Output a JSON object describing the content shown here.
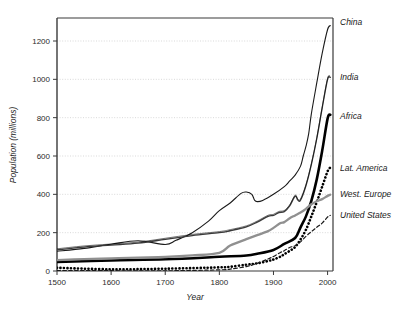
{
  "chart_data": {
    "type": "line",
    "title": "",
    "xlabel": "Year",
    "ylabel": "Population (millions)",
    "xlim": [
      1500,
      2010
    ],
    "ylim": [
      0,
      1320
    ],
    "xticks": [
      1500,
      1600,
      1700,
      1800,
      1900,
      2000
    ],
    "xticklabels": [
      "1500",
      "1600",
      "1700",
      "1800",
      "1900",
      "2000"
    ],
    "yticks": [
      0,
      200,
      400,
      600,
      800,
      1000,
      1200
    ],
    "yticklabels": [
      "0",
      "200",
      "400",
      "600",
      "800",
      "1000",
      "1200"
    ],
    "grid": "horizontal-dotted",
    "legend_position": "right-of-axes-inline",
    "series": [
      {
        "name": "China",
        "label": "China",
        "style": "solid",
        "color": "#1a1a1a",
        "width": 1.1,
        "label_y_value": 1300,
        "x": [
          1500,
          1550,
          1600,
          1650,
          1700,
          1720,
          1750,
          1780,
          1800,
          1820,
          1840,
          1850,
          1860,
          1865,
          1870,
          1880,
          1900,
          1920,
          1930,
          1940,
          1950,
          1955,
          1960,
          1965,
          1970,
          1980,
          1990,
          2000,
          2005
        ],
        "values": [
          103,
          118,
          140,
          158,
          138,
          160,
          200,
          260,
          315,
          355,
          405,
          412,
          400,
          370,
          362,
          368,
          400,
          440,
          470,
          500,
          547,
          600,
          650,
          715,
          820,
          981,
          1135,
          1260,
          1280
        ]
      },
      {
        "name": "India",
        "label": "India",
        "style": "solid-double",
        "color": "#3a3a3a",
        "width": 1.3,
        "label_y_value": 1010,
        "x": [
          1500,
          1550,
          1600,
          1650,
          1700,
          1750,
          1800,
          1820,
          1850,
          1870,
          1890,
          1900,
          1910,
          1920,
          1930,
          1940,
          1945,
          1950,
          1960,
          1970,
          1980,
          1990,
          2000,
          2005
        ],
        "values": [
          110,
          125,
          135,
          145,
          165,
          185,
          200,
          210,
          230,
          255,
          285,
          290,
          305,
          310,
          340,
          390,
          370,
          370,
          445,
          555,
          690,
          850,
          1000,
          1010
        ]
      },
      {
        "name": "Africa",
        "label": "Africa",
        "style": "thick-solid",
        "color": "#000000",
        "width": 2.6,
        "label_y_value": 810,
        "x": [
          1500,
          1600,
          1700,
          1800,
          1850,
          1870,
          1900,
          1920,
          1940,
          1950,
          1960,
          1970,
          1980,
          1990,
          2000,
          2005
        ],
        "values": [
          47,
          55,
          61,
          74,
          81,
          90,
          110,
          141,
          172,
          228,
          285,
          366,
          478,
          627,
          795,
          815
        ]
      },
      {
        "name": "Lat. America",
        "label": "Lat. America",
        "style": "dotted",
        "color": "#000000",
        "width": 2.6,
        "label_y_value": 540,
        "x": [
          1500,
          1600,
          1700,
          1800,
          1820,
          1850,
          1870,
          1890,
          1900,
          1913,
          1920,
          1930,
          1940,
          1950,
          1960,
          1970,
          1980,
          1990,
          2000,
          2005
        ],
        "values": [
          17,
          9,
          12,
          19,
          22,
          33,
          40,
          52,
          60,
          75,
          88,
          105,
          125,
          165,
          215,
          285,
          360,
          440,
          520,
          540
        ]
      },
      {
        "name": "West. Europe",
        "label": "West. Europe",
        "style": "solid",
        "color": "#909090",
        "width": 2.3,
        "label_y_value": 400,
        "x": [
          1500,
          1550,
          1600,
          1650,
          1700,
          1750,
          1800,
          1820,
          1850,
          1870,
          1890,
          1900,
          1913,
          1920,
          1930,
          1940,
          1950,
          1960,
          1970,
          1980,
          1990,
          2000,
          2005
        ],
        "values": [
          57,
          62,
          66,
          70,
          73,
          81,
          95,
          133,
          166,
          187,
          208,
          225,
          250,
          255,
          275,
          290,
          305,
          324,
          348,
          364,
          375,
          392,
          398
        ]
      },
      {
        "name": "United States",
        "label": "United States",
        "style": "dashed",
        "color": "#1a1a1a",
        "width": 1.2,
        "label_y_value": 290,
        "x": [
          1500,
          1600,
          1700,
          1800,
          1820,
          1850,
          1870,
          1890,
          1900,
          1913,
          1920,
          1930,
          1940,
          1950,
          1960,
          1970,
          1980,
          1990,
          2000,
          2005
        ],
        "values": [
          2,
          1.5,
          1,
          6,
          10,
          23,
          40,
          63,
          76,
          97,
          106,
          123,
          132,
          152,
          181,
          205,
          228,
          250,
          282,
          290
        ]
      }
    ]
  },
  "axes": {
    "xlabel": "Year",
    "ylabel": "Population (millions)"
  }
}
